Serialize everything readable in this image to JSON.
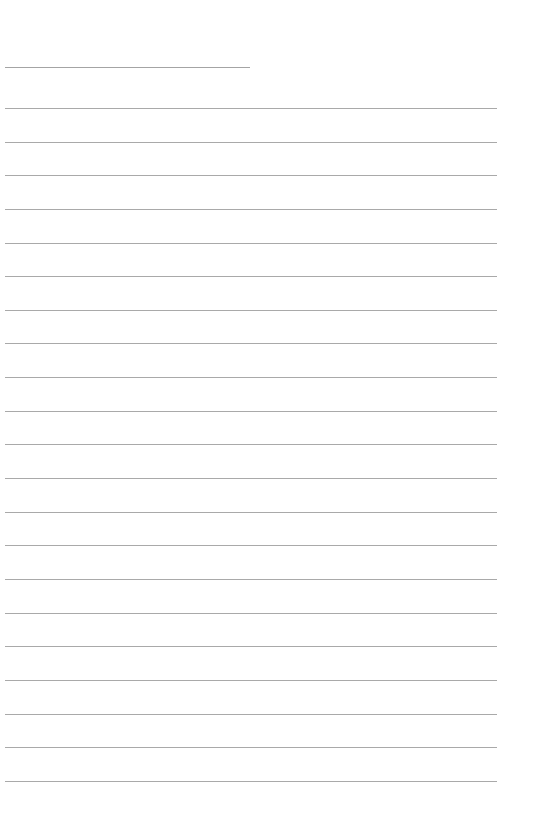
{
  "page": {
    "type": "blank lined writing sheet",
    "background_color": "#ffffff",
    "line_color": "#a9a9a9"
  },
  "title_line": {
    "text": "",
    "x_start": 5,
    "x_end": 250,
    "y": 67
  },
  "writing_lines": {
    "count": 21,
    "x_start": 5,
    "x_end": 497,
    "y_positions": [
      108,
      142,
      175,
      209,
      243,
      276,
      310,
      343,
      377,
      411,
      444,
      478,
      512,
      545,
      579,
      613,
      646,
      680,
      714,
      747,
      781
    ],
    "contents": [
      "",
      "",
      "",
      "",
      "",
      "",
      "",
      "",
      "",
      "",
      "",
      "",
      "",
      "",
      "",
      "",
      "",
      "",
      "",
      "",
      ""
    ]
  }
}
